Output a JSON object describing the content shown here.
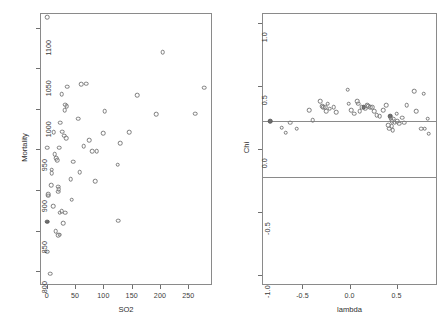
{
  "figure": {
    "type": "multi-panel-scatter",
    "panel_count": 2,
    "background": "#ffffff",
    "point_color": "#7b7b7b",
    "line_color": "#8a8a8a"
  },
  "chart_data": [
    {
      "type": "scatter",
      "panel": "left",
      "title": "",
      "xlabel": "SO2",
      "ylabel": "Mortality",
      "xlim": [
        -12,
        292
      ],
      "ylim": [
        783,
        1118
      ],
      "xticks": [
        0,
        50,
        100,
        150,
        200,
        250
      ],
      "xticklabels": [
        "0",
        "50",
        "100",
        "150",
        "200",
        "250"
      ],
      "yticks": [
        800,
        850,
        900,
        950,
        1000,
        1050,
        1100
      ],
      "yticklabels": [
        "800",
        "850",
        "900",
        "950",
        "1000",
        "1050",
        "1100"
      ],
      "grid": false,
      "legend": null,
      "marker": "open-circle",
      "points": [
        {
          "x": 1,
          "y": 1113,
          "filled": false
        },
        {
          "x": 205,
          "y": 1070,
          "filled": false
        },
        {
          "x": 61,
          "y": 1030,
          "filled": false
        },
        {
          "x": 70,
          "y": 1031,
          "filled": false
        },
        {
          "x": 278,
          "y": 1026,
          "filled": false
        },
        {
          "x": 36,
          "y": 1027,
          "filled": false
        },
        {
          "x": 160,
          "y": 1017,
          "filled": false
        },
        {
          "x": 26,
          "y": 1018,
          "filled": false
        },
        {
          "x": 33,
          "y": 1005,
          "filled": false
        },
        {
          "x": 35,
          "y": 1003,
          "filled": false
        },
        {
          "x": 32,
          "y": 998,
          "filled": false
        },
        {
          "x": 102,
          "y": 997,
          "filled": false
        },
        {
          "x": 193,
          "y": 993,
          "filled": false
        },
        {
          "x": 262,
          "y": 994,
          "filled": false
        },
        {
          "x": 56,
          "y": 988,
          "filled": false
        },
        {
          "x": 24,
          "y": 983,
          "filled": false
        },
        {
          "x": 27,
          "y": 972,
          "filled": false
        },
        {
          "x": 12,
          "y": 971,
          "filled": false
        },
        {
          "x": 100,
          "y": 970,
          "filled": false
        },
        {
          "x": 146,
          "y": 971,
          "filled": false
        },
        {
          "x": 31,
          "y": 967,
          "filled": false
        },
        {
          "x": 34,
          "y": 964,
          "filled": false
        },
        {
          "x": 75,
          "y": 961,
          "filled": false
        },
        {
          "x": 130,
          "y": 958,
          "filled": false
        },
        {
          "x": 1,
          "y": 952,
          "filled": false
        },
        {
          "x": 65,
          "y": 954,
          "filled": false
        },
        {
          "x": 22,
          "y": 952,
          "filled": false
        },
        {
          "x": 88,
          "y": 948,
          "filled": false
        },
        {
          "x": 80,
          "y": 948,
          "filled": false
        },
        {
          "x": 14,
          "y": 944,
          "filled": false
        },
        {
          "x": 17,
          "y": 939,
          "filled": false
        },
        {
          "x": 18,
          "y": 937,
          "filled": false
        },
        {
          "x": 47,
          "y": 935,
          "filled": false
        },
        {
          "x": 125,
          "y": 931,
          "filled": false
        },
        {
          "x": 9,
          "y": 925,
          "filled": false
        },
        {
          "x": 9,
          "y": 921,
          "filled": false
        },
        {
          "x": 58,
          "y": 922,
          "filled": false
        },
        {
          "x": 42,
          "y": 913,
          "filled": false
        },
        {
          "x": 86,
          "y": 911,
          "filled": false
        },
        {
          "x": 8,
          "y": 906,
          "filled": false
        },
        {
          "x": 20,
          "y": 904,
          "filled": false
        },
        {
          "x": 21,
          "y": 901,
          "filled": false
        },
        {
          "x": 20,
          "y": 898,
          "filled": false
        },
        {
          "x": 3,
          "y": 895,
          "filled": false
        },
        {
          "x": 2,
          "y": 893,
          "filled": false
        },
        {
          "x": 44,
          "y": 888,
          "filled": false
        },
        {
          "x": 11,
          "y": 880,
          "filled": false
        },
        {
          "x": 26,
          "y": 874,
          "filled": false
        },
        {
          "x": 23,
          "y": 872,
          "filled": false
        },
        {
          "x": 33,
          "y": 872,
          "filled": false
        },
        {
          "x": 1,
          "y": 861,
          "filled": true
        },
        {
          "x": 126,
          "y": 862,
          "filled": false
        },
        {
          "x": 29,
          "y": 859,
          "filled": false
        },
        {
          "x": 16,
          "y": 849,
          "filled": false
        },
        {
          "x": 23,
          "y": 845,
          "filled": false
        },
        {
          "x": 20,
          "y": 844,
          "filled": false
        },
        {
          "x": 1,
          "y": 824,
          "filled": false
        },
        {
          "x": 6,
          "y": 797,
          "filled": false
        }
      ]
    },
    {
      "type": "scatter",
      "panel": "right",
      "title": "",
      "xlabel": "lambda",
      "ylabel": "Chi",
      "xlim": [
        -0.93,
        0.93
      ],
      "ylim": [
        -1.08,
        1.08
      ],
      "xticks": [
        -0.5,
        0.0,
        0.5
      ],
      "xticklabels": [
        "-0.5",
        "0.0",
        "0.5"
      ],
      "yticks": [
        -1.0,
        -0.5,
        0.0,
        0.5,
        1.0
      ],
      "yticklabels": [
        "-1.0",
        "-0.5",
        "0.0",
        "0.5",
        "1.0"
      ],
      "grid": false,
      "legend": null,
      "marker": "open-circle",
      "reference_lines": [
        {
          "orientation": "horizontal",
          "y": 0.22
        },
        {
          "orientation": "horizontal",
          "y": -0.22
        }
      ],
      "points": [
        {
          "x": -0.84,
          "y": 0.22,
          "filled": true
        },
        {
          "x": -0.72,
          "y": 0.17,
          "filled": false
        },
        {
          "x": -0.68,
          "y": 0.13,
          "filled": false
        },
        {
          "x": -0.63,
          "y": 0.21,
          "filled": false
        },
        {
          "x": -0.56,
          "y": 0.16,
          "filled": false
        },
        {
          "x": -0.43,
          "y": 0.31,
          "filled": false
        },
        {
          "x": -0.39,
          "y": 0.23,
          "filled": false
        },
        {
          "x": -0.31,
          "y": 0.38,
          "filled": false
        },
        {
          "x": -0.29,
          "y": 0.34,
          "filled": false
        },
        {
          "x": -0.28,
          "y": 0.33,
          "filled": false
        },
        {
          "x": -0.26,
          "y": 0.33,
          "filled": false
        },
        {
          "x": -0.25,
          "y": 0.3,
          "filled": false
        },
        {
          "x": -0.23,
          "y": 0.36,
          "filled": false
        },
        {
          "x": -0.21,
          "y": 0.32,
          "filled": false
        },
        {
          "x": -0.17,
          "y": 0.33,
          "filled": false
        },
        {
          "x": -0.14,
          "y": 0.29,
          "filled": false
        },
        {
          "x": -0.02,
          "y": 0.47,
          "filled": false
        },
        {
          "x": -0.01,
          "y": 0.36,
          "filled": false
        },
        {
          "x": 0.02,
          "y": 0.31,
          "filled": false
        },
        {
          "x": 0.05,
          "y": 0.28,
          "filled": false
        },
        {
          "x": 0.08,
          "y": 0.38,
          "filled": false
        },
        {
          "x": 0.09,
          "y": 0.36,
          "filled": false
        },
        {
          "x": 0.11,
          "y": 0.3,
          "filled": false
        },
        {
          "x": 0.13,
          "y": 0.33,
          "filled": false
        },
        {
          "x": 0.15,
          "y": 0.33,
          "filled": true
        },
        {
          "x": 0.17,
          "y": 0.32,
          "filled": false
        },
        {
          "x": 0.19,
          "y": 0.35,
          "filled": false
        },
        {
          "x": 0.2,
          "y": 0.34,
          "filled": false
        },
        {
          "x": 0.22,
          "y": 0.33,
          "filled": false
        },
        {
          "x": 0.24,
          "y": 0.33,
          "filled": false
        },
        {
          "x": 0.26,
          "y": 0.3,
          "filled": false
        },
        {
          "x": 0.29,
          "y": 0.27,
          "filled": false
        },
        {
          "x": 0.32,
          "y": 0.26,
          "filled": false
        },
        {
          "x": 0.36,
          "y": 0.31,
          "filled": false
        },
        {
          "x": 0.39,
          "y": 0.35,
          "filled": false
        },
        {
          "x": 0.41,
          "y": 0.19,
          "filled": false
        },
        {
          "x": 0.42,
          "y": 0.16,
          "filled": false
        },
        {
          "x": 0.43,
          "y": 0.26,
          "filled": true
        },
        {
          "x": 0.44,
          "y": 0.24,
          "filled": false
        },
        {
          "x": 0.45,
          "y": 0.22,
          "filled": false
        },
        {
          "x": 0.45,
          "y": 0.18,
          "filled": false
        },
        {
          "x": 0.46,
          "y": 0.15,
          "filled": false
        },
        {
          "x": 0.47,
          "y": 0.24,
          "filled": false
        },
        {
          "x": 0.48,
          "y": 0.21,
          "filled": false
        },
        {
          "x": 0.5,
          "y": 0.28,
          "filled": false
        },
        {
          "x": 0.51,
          "y": 0.22,
          "filled": false
        },
        {
          "x": 0.53,
          "y": 0.2,
          "filled": false
        },
        {
          "x": 0.56,
          "y": 0.25,
          "filled": false
        },
        {
          "x": 0.58,
          "y": 0.21,
          "filled": false
        },
        {
          "x": 0.61,
          "y": 0.35,
          "filled": false
        },
        {
          "x": 0.69,
          "y": 0.46,
          "filled": false
        },
        {
          "x": 0.71,
          "y": 0.3,
          "filled": false
        },
        {
          "x": 0.76,
          "y": 0.16,
          "filled": false
        },
        {
          "x": 0.79,
          "y": 0.44,
          "filled": false
        },
        {
          "x": 0.8,
          "y": 0.16,
          "filled": false
        },
        {
          "x": 0.83,
          "y": 0.24,
          "filled": false
        },
        {
          "x": 0.84,
          "y": 0.12,
          "filled": false
        }
      ]
    }
  ]
}
